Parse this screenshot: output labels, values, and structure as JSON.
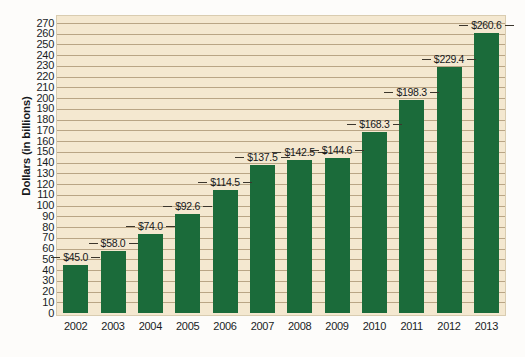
{
  "chart_data": {
    "type": "bar",
    "title": "",
    "subtitle": "",
    "xlabel": "",
    "ylabel": "Dollars (in billions)",
    "categories": [
      "2002",
      "2003",
      "2004",
      "2005",
      "2006",
      "2007",
      "2008",
      "2009",
      "2010",
      "2011",
      "2012",
      "2013"
    ],
    "values": [
      45.0,
      58.0,
      74.0,
      92.6,
      114.5,
      137.5,
      142.5,
      144.6,
      168.3,
      198.3,
      229.4,
      260.6
    ],
    "data_labels": [
      "$45.0",
      "$58.0",
      "$74.0",
      "$92.6",
      "$114.5",
      "$137.5",
      "$142.5",
      "$144.6",
      "$168.3",
      "$198.3",
      "$229.4",
      "$260.6"
    ],
    "ylim": [
      0,
      270
    ],
    "y_tick_step": 10,
    "y_tick_labels": [
      "270",
      "260",
      "250",
      "240",
      "230",
      "220",
      "210",
      "200",
      "190",
      "180",
      "170",
      "160",
      "150",
      "140",
      "130",
      "120",
      "110",
      "100",
      "90",
      "80",
      "70",
      "60",
      "50",
      "40",
      "30",
      "20",
      "10",
      "0"
    ],
    "grid": true,
    "legend": false,
    "legend_position": "none",
    "colors": {
      "bar": "#1b6b3a",
      "plot_background": "#f4e8d0",
      "gridline": "#b9a585",
      "page_background": "#fdfcfa",
      "text": "#16181b"
    }
  }
}
